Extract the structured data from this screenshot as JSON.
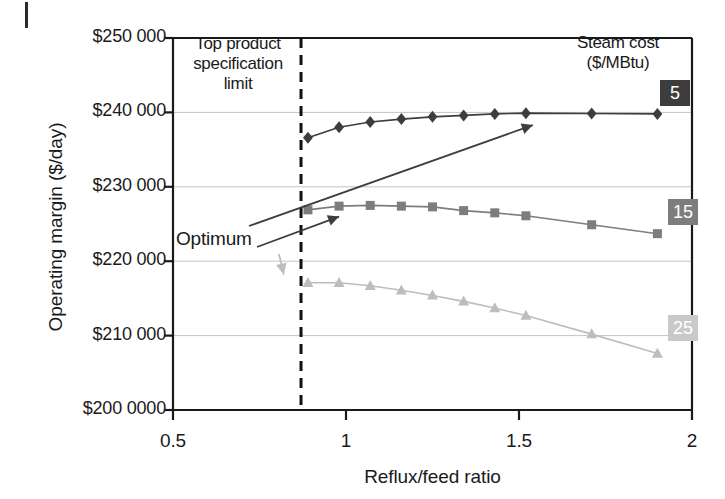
{
  "figure": {
    "y_axis_title": "Operating margin ($/day)",
    "x_axis_title": "Reflux/feed ratio",
    "spec_limit_note": "Top product specification limit",
    "optimum_note": "Optimum",
    "legend_title": "Steam cost ($/MBtu)"
  },
  "chart_data": {
    "type": "line",
    "title": "",
    "xlabel": "Reflux/feed ratio",
    "ylabel": "Operating margin ($/day)",
    "xlim": [
      0.5,
      2
    ],
    "ylim": [
      200000,
      250000
    ],
    "xticks": [
      0.5,
      1,
      1.5,
      2
    ],
    "xtick_labels": [
      "0.5",
      "1",
      "1.5",
      "2"
    ],
    "yticks": [
      200000,
      210000,
      220000,
      230000,
      240000,
      250000
    ],
    "ytick_labels": [
      "$200 0000",
      "$210 000",
      "$220 000",
      "$230 000",
      "$240 000",
      "$250 000"
    ],
    "grid": true,
    "legend_position": "right",
    "legend_title": "Steam cost ($/MBtu)",
    "annotations": [
      {
        "name": "spec-limit",
        "text": "Top product specification limit",
        "kind": "vertical-dashed-line",
        "x": 0.87
      },
      {
        "name": "optimum",
        "text": "Optimum",
        "kind": "label-with-arrows",
        "arrow_targets": [
          {
            "x": 1.54,
            "y": 238300
          },
          {
            "x": 0.98,
            "y": 226000
          },
          {
            "x": 0.82,
            "y": 218200
          }
        ]
      }
    ],
    "series": [
      {
        "name": "5",
        "label": "5",
        "marker": "diamond",
        "color": "#3d3d3d",
        "x": [
          0.89,
          0.98,
          1.07,
          1.16,
          1.25,
          1.34,
          1.43,
          1.52,
          1.71,
          1.9
        ],
        "values": [
          236600,
          238000,
          238700,
          239100,
          239400,
          239600,
          239800,
          239900,
          239850,
          239800
        ]
      },
      {
        "name": "15",
        "label": "15",
        "marker": "square",
        "color": "#7d7d7d",
        "x": [
          0.89,
          0.98,
          1.07,
          1.16,
          1.25,
          1.34,
          1.43,
          1.52,
          1.71,
          1.9
        ],
        "values": [
          226900,
          227400,
          227500,
          227400,
          227300,
          226800,
          226500,
          226100,
          224900,
          223700
        ]
      },
      {
        "name": "25",
        "label": "25",
        "marker": "triangle",
        "color": "#bdbdbd",
        "x": [
          0.89,
          0.98,
          1.07,
          1.16,
          1.25,
          1.34,
          1.43,
          1.52,
          1.71,
          1.9
        ],
        "values": [
          217100,
          217100,
          216700,
          216100,
          215400,
          214600,
          213700,
          212700,
          210200,
          207600
        ]
      }
    ]
  }
}
